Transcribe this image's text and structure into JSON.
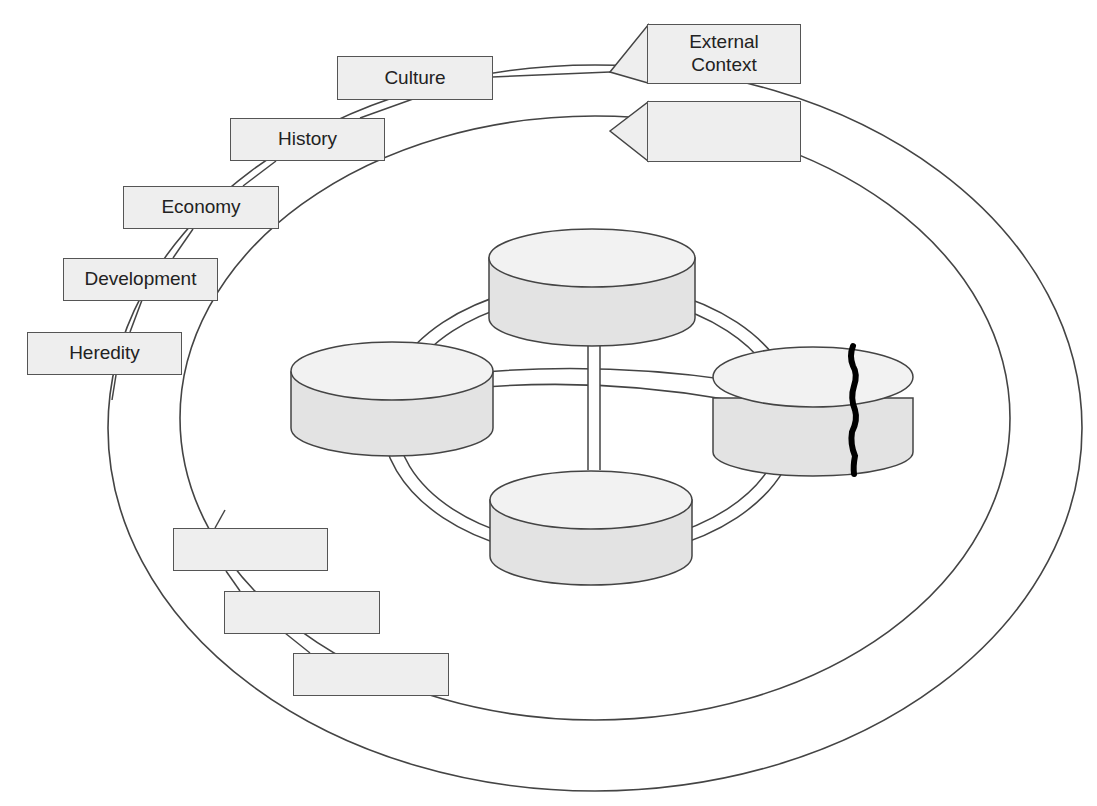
{
  "diagram": {
    "type": "concentric-context-model",
    "colors": {
      "stroke": "#444444",
      "box_fill": "#eeeeee",
      "cylinder_fill": "#e3e3e3",
      "cylinder_top": "#f2f2f2",
      "crack": "#000000",
      "background": "#ffffff"
    },
    "outer_ring": {
      "label": "External Context",
      "factors": [
        "Culture",
        "History",
        "Economy",
        "Development",
        "Heredity"
      ]
    },
    "inner_ring": {
      "label": "",
      "factors": [
        "",
        "",
        ""
      ]
    },
    "cylinders": [
      {
        "position": "top",
        "label": ""
      },
      {
        "position": "left",
        "label": ""
      },
      {
        "position": "right",
        "label": "",
        "cracked": true
      },
      {
        "position": "bottom",
        "label": ""
      }
    ]
  }
}
